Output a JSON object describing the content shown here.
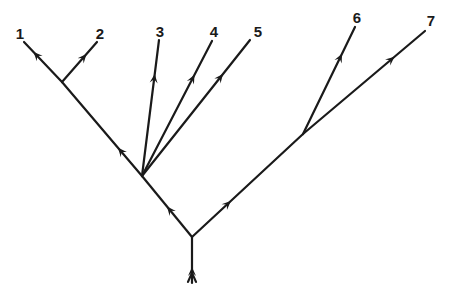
{
  "diagram": {
    "type": "branching-tree",
    "direction": "upward",
    "stroke_color": "#1a1a1a",
    "background": "#ffffff",
    "nodes": {
      "root": {
        "x": 192,
        "y": 237
      },
      "entry": {
        "x": 192,
        "y": 283
      },
      "A": {
        "x": 142,
        "y": 176
      },
      "B": {
        "x": 303,
        "y": 134
      },
      "C": {
        "x": 62,
        "y": 82
      },
      "t1": {
        "x": 24,
        "y": 42
      },
      "t2": {
        "x": 97,
        "y": 42
      },
      "t3": {
        "x": 159,
        "y": 40
      },
      "t4": {
        "x": 212,
        "y": 41
      },
      "t5": {
        "x": 250,
        "y": 40
      },
      "t6": {
        "x": 355,
        "y": 27
      },
      "t7": {
        "x": 425,
        "y": 31
      }
    },
    "edges": [
      {
        "from": "entry",
        "to": "root",
        "arrow_at": 0.35,
        "double_arrow": true
      },
      {
        "from": "root",
        "to": "A",
        "arrow_at": 0.5
      },
      {
        "from": "root",
        "to": "B",
        "arrow_at": 0.35
      },
      {
        "from": "A",
        "to": "C",
        "arrow_at": 0.3
      },
      {
        "from": "C",
        "to": "t1",
        "arrow_at": 0.75
      },
      {
        "from": "C",
        "to": "t2",
        "arrow_at": 0.7
      },
      {
        "from": "A",
        "to": "t3",
        "arrow_at": 0.75
      },
      {
        "from": "A",
        "to": "t4",
        "arrow_at": 0.75
      },
      {
        "from": "A",
        "to": "t5",
        "arrow_at": 0.75
      },
      {
        "from": "B",
        "to": "t6",
        "arrow_at": 0.75
      },
      {
        "from": "B",
        "to": "t7",
        "arrow_at": 0.75
      }
    ],
    "labels": [
      {
        "id": "label-1",
        "text": "1",
        "x": 20,
        "y": 33
      },
      {
        "id": "label-2",
        "text": "2",
        "x": 100,
        "y": 33
      },
      {
        "id": "label-3",
        "text": "3",
        "x": 160,
        "y": 31
      },
      {
        "id": "label-4",
        "text": "4",
        "x": 214,
        "y": 31
      },
      {
        "id": "label-5",
        "text": "5",
        "x": 258,
        "y": 31
      },
      {
        "id": "label-6",
        "text": "6",
        "x": 357,
        "y": 17
      },
      {
        "id": "label-7",
        "text": "7",
        "x": 431,
        "y": 20
      }
    ]
  }
}
